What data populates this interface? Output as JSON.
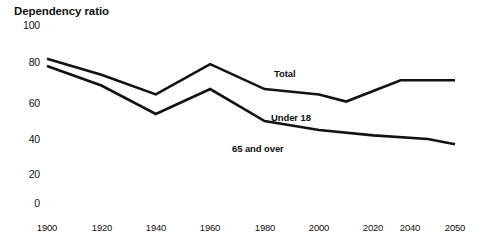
{
  "chart_data": {
    "type": "line",
    "title": "Dependency ratio",
    "xlabel": "",
    "ylabel": "",
    "ylim": [
      0,
      100
    ],
    "xlim": [
      1900,
      2050
    ],
    "grid": false,
    "legend_position": "inline-annotations",
    "yticks": [
      0,
      20,
      40,
      60,
      80,
      100
    ],
    "ytick_labels": [
      "0",
      "20",
      "40",
      "60",
      "80",
      "100"
    ],
    "xticks": [
      1900,
      1920,
      1940,
      1960,
      1980,
      2000,
      2020,
      2040,
      2050
    ],
    "xtick_labels": [
      "1900",
      "1920",
      "1940",
      "1960",
      "1980",
      "2000",
      "2020",
      "2040",
      "2050"
    ],
    "series": [
      {
        "name": "Total",
        "x": [
          1900,
          1920,
          1940,
          1960,
          1980,
          2000,
          2010,
          2030,
          2050
        ],
        "values": [
          81,
          72,
          61,
          78,
          64,
          61,
          57,
          69,
          69
        ]
      },
      {
        "name": "Under 18",
        "x": [
          1900,
          1920,
          1940,
          1960,
          1980,
          2000,
          2020,
          2040,
          2050
        ],
        "values": [
          77,
          66,
          50,
          64,
          46,
          41,
          38,
          36,
          33
        ]
      }
    ],
    "annotations": [
      {
        "text": "Total",
        "x": 2000,
        "y": 72
      },
      {
        "text": "Under 18",
        "x": 2005,
        "y": 46
      },
      {
        "text": "65 and over",
        "x": 2005,
        "y": 32
      }
    ]
  },
  "axis": {
    "y_labels": [
      "100",
      "80",
      "60",
      "40",
      "20",
      "0"
    ],
    "x_labels": [
      "1900",
      "1920",
      "1940",
      "1960",
      "1980",
      "2000",
      "2020",
      "2040",
      "2050"
    ]
  },
  "labels": {
    "title": "Dependency ratio",
    "total": "Total",
    "under18": "Under 18",
    "over65": "65 and over"
  }
}
